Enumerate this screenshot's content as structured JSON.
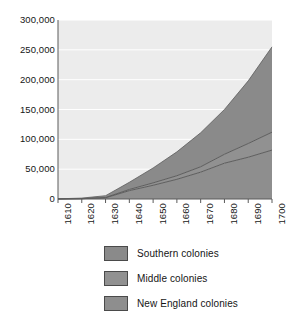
{
  "chart_data": {
    "type": "area",
    "stacked": true,
    "title": "",
    "subtitle": "",
    "xlabel": "",
    "ylabel": "",
    "x": [
      1610,
      1620,
      1630,
      1640,
      1650,
      1660,
      1670,
      1680,
      1690,
      1700
    ],
    "categories": [
      "1610",
      "1620",
      "1630",
      "1640",
      "1650",
      "1660",
      "1670",
      "1680",
      "1690",
      "1700"
    ],
    "xlim": [
      1610,
      1700
    ],
    "ylim": [
      0,
      300000
    ],
    "y_ticks": [
      0,
      50000,
      100000,
      150000,
      200000,
      250000,
      300000
    ],
    "y_tick_labels": [
      "0",
      "50,000",
      "100,000",
      "150,000",
      "200,000",
      "250,000",
      "300,000"
    ],
    "x_ticks": [
      1610,
      1620,
      1630,
      1640,
      1650,
      1660,
      1670,
      1680,
      1690,
      1700
    ],
    "x_tick_labels": [
      "1610",
      "1620",
      "1630",
      "1640",
      "1650",
      "1660",
      "1670",
      "1680",
      "1690",
      "1700"
    ],
    "grid": true,
    "grid_axis": "y",
    "legend_position": "bottom",
    "series": [
      {
        "name": "New England colonies",
        "color": "#8e8e8e",
        "values": [
          0,
          500,
          2000,
          14000,
          23000,
          33000,
          45000,
          60000,
          70000,
          82000
        ]
      },
      {
        "name": "Middle colonies",
        "color": "#919191",
        "values": [
          0,
          0,
          500,
          2000,
          4000,
          6000,
          9000,
          15000,
          23000,
          30000
        ]
      },
      {
        "name": "Southern colonies",
        "color": "#8a8a8a",
        "values": [
          300,
          1000,
          3000,
          12000,
          25000,
          40000,
          57000,
          75000,
          105000,
          143000
        ]
      }
    ],
    "stack_totals": [
      300,
      1500,
      5500,
      28000,
      52000,
      79000,
      111000,
      150000,
      198000,
      255000
    ]
  },
  "legend": {
    "items": [
      {
        "label": "Southern colonies",
        "color": "#8a8a8a"
      },
      {
        "label": "Middle colonies",
        "color": "#919191"
      },
      {
        "label": "New England colonies",
        "color": "#8e8e8e"
      }
    ]
  },
  "style": {
    "plot_background": "#ececec",
    "page_background": "#ffffff",
    "gridline_color": "#ffffff",
    "axis_color": "#5a5a5a",
    "boundary_line_color": "#5d5d5d",
    "text_color": "#151515"
  }
}
